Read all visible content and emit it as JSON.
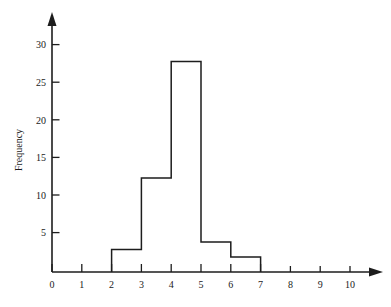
{
  "chart_data": {
    "type": "bar",
    "title": "",
    "subtitle": "",
    "xlabel": "",
    "ylabel": "Frequency",
    "categories": [
      "0-1",
      "1-2",
      "2-3",
      "3-4",
      "4-5",
      "5-6",
      "6-7",
      "7-8",
      "8-9",
      "9-10"
    ],
    "bin_edges": [
      0,
      1,
      2,
      3,
      4,
      5,
      6,
      7,
      8,
      9,
      10
    ],
    "values": [
      0,
      0,
      3,
      12.5,
      28,
      4,
      2,
      0,
      0,
      0
    ],
    "bars": [
      {
        "label": "2-3",
        "start": 2,
        "end": 3,
        "value": 3
      },
      {
        "label": "3-4",
        "start": 3,
        "end": 4,
        "value": 12.5
      },
      {
        "label": "4-5",
        "start": 4,
        "end": 5,
        "value": 28
      },
      {
        "label": "5-6",
        "start": 5,
        "end": 6,
        "value": 4
      },
      {
        "label": "6-7",
        "start": 6,
        "end": 7,
        "value": 2
      }
    ],
    "xlim": [
      0,
      10
    ],
    "ylim": [
      0,
      32
    ],
    "xticks": [
      0,
      1,
      2,
      3,
      4,
      5,
      6,
      7,
      8,
      9,
      10
    ],
    "xtick_labels": [
      "0",
      "1",
      "2",
      "3",
      "4",
      "5",
      "6",
      "7",
      "8",
      "9",
      "10"
    ],
    "yticks": [
      5,
      10,
      15,
      20,
      25,
      30
    ],
    "ytick_labels": [
      "5",
      "10",
      "15",
      "20",
      "25",
      "30"
    ],
    "grid": false,
    "legend": null,
    "legend_position": "none",
    "axis_style": "arrow-terminated",
    "colors": {
      "axis": "#1d1d1d",
      "bar_stroke": "#1d1d1d",
      "bar_fill": "none",
      "background": "#ffffff",
      "text": "#1a1a1a"
    }
  }
}
